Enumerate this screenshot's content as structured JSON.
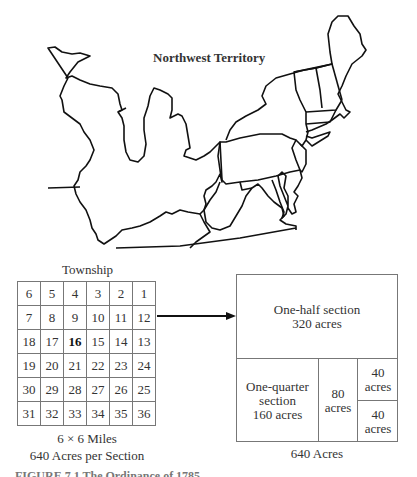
{
  "map": {
    "title": "Northwest Territory"
  },
  "township": {
    "title": "Township",
    "grid": [
      [
        "6",
        "5",
        "4",
        "3",
        "2",
        "1"
      ],
      [
        "7",
        "8",
        "9",
        "10",
        "11",
        "12"
      ],
      [
        "18",
        "17",
        "16",
        "15",
        "14",
        "13"
      ],
      [
        "19",
        "20",
        "21",
        "22",
        "23",
        "24"
      ],
      [
        "30",
        "29",
        "28",
        "27",
        "26",
        "25"
      ],
      [
        "31",
        "32",
        "33",
        "34",
        "35",
        "36"
      ]
    ],
    "highlighted_section": "16",
    "caption_dimensions": "6 × 6 Miles",
    "caption_acres": "640 Acres per Section"
  },
  "section": {
    "half": {
      "line1": "One-half section",
      "line2": "320 acres"
    },
    "quarter": {
      "line1": "One-quarter",
      "line2": "section",
      "line3": "160 acres"
    },
    "eighty": {
      "line1": "80",
      "line2": "acres"
    },
    "forty_top": {
      "line1": "40",
      "line2": "acres"
    },
    "forty_bottom": {
      "line1": "40",
      "line2": "acres"
    },
    "total": "640 Acres"
  },
  "figure_caption": "FIGURE 7.1   The Ordinance of 1785"
}
